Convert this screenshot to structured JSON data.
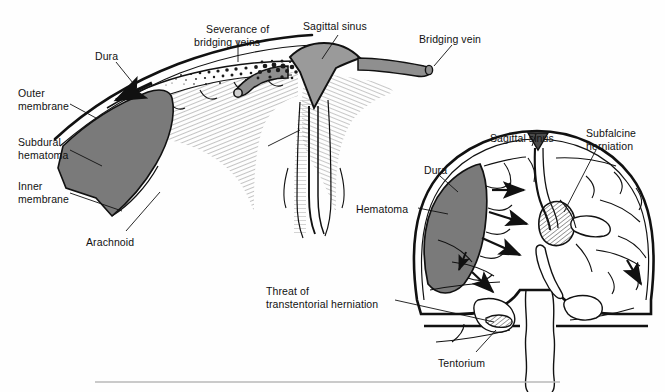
{
  "figure": {
    "type": "medical-illustration",
    "background_color": "#fefefe",
    "line_color": "#111111",
    "hematoma_fill": "#7a7a7a",
    "sinus_fill": "#9a9a9a",
    "vein_fill": "#8f8f8f",
    "hatch_fill": "#d8d8d8",
    "panels": [
      {
        "name": "coronal-detail-left",
        "caption": "Magnified view of dura, subdural hematoma and severed bridging veins at the sagittal sinus"
      },
      {
        "name": "coronal-whole-brain-right",
        "caption": "Whole coronal section showing mass effect of hematoma with subfalcine and transtentorial herniation"
      }
    ]
  },
  "labels": {
    "left_panel": [
      {
        "id": "severance-of-bridging-veins",
        "text": "Severance of\nbridging veins",
        "x": 194,
        "y": 10,
        "align": "left"
      },
      {
        "id": "sagittal-sinus",
        "text": "Sagittal sinus",
        "x": 303,
        "y": 20,
        "align": "left"
      },
      {
        "id": "bridging-vein",
        "text": "Bridging vein",
        "x": 419,
        "y": 33,
        "align": "left"
      },
      {
        "id": "dura",
        "text": "Dura",
        "x": 95,
        "y": 50,
        "align": "left"
      },
      {
        "id": "outer-membrane",
        "text": "Outer\nmembrane",
        "x": 18,
        "y": 87,
        "align": "left"
      },
      {
        "id": "subdural-hematoma",
        "text": "Subdural\nhematoma",
        "x": 18,
        "y": 136,
        "align": "left"
      },
      {
        "id": "inner-membrane",
        "text": "Inner\nmembrane",
        "x": 18,
        "y": 180,
        "align": "left"
      },
      {
        "id": "arachnoid",
        "text": "Arachnoid",
        "x": 86,
        "y": 236,
        "align": "left"
      }
    ],
    "right_panel": [
      {
        "id": "sagittal-sinus-2",
        "text": "Sagittal sinus",
        "x": 490,
        "y": 132,
        "align": "left"
      },
      {
        "id": "subfalcine-herniation",
        "text": "Subfalcine\nherniation",
        "x": 586,
        "y": 127,
        "align": "left"
      },
      {
        "id": "dura-2",
        "text": "Dura",
        "x": 424,
        "y": 164,
        "align": "left"
      },
      {
        "id": "hematoma",
        "text": "Hematoma",
        "x": 356,
        "y": 203,
        "align": "left"
      },
      {
        "id": "threat-of-transtentorial-herniation",
        "text": "Threat of\ntranstentorial herniation",
        "x": 266,
        "y": 285,
        "align": "left"
      },
      {
        "id": "tentorium",
        "text": "Tentorium",
        "x": 438,
        "y": 357,
        "align": "left"
      }
    ]
  },
  "footer": {
    "rule": {
      "x": 95,
      "y": 382,
      "width": 465,
      "color": "#b9b9b9"
    }
  }
}
